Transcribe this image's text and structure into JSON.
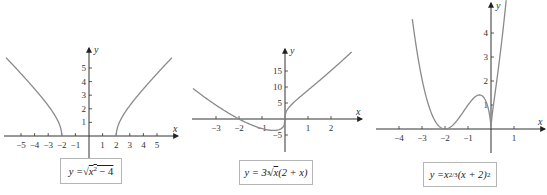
{
  "chart_data": [
    {
      "type": "line",
      "title": "y = √(x² − 4)",
      "caption": {
        "prefix": "y = ",
        "radical": "√",
        "radicand_base": "x",
        "radicand_exp": "2",
        "radicand_rest": " − 4"
      },
      "xlabel": "x",
      "ylabel": "y",
      "xticks": [
        -5,
        -4,
        -3,
        -2,
        -1,
        1,
        2,
        3,
        4,
        5
      ],
      "xtick_labels": [
        "−5",
        "−4",
        "−3",
        "−2",
        "−1",
        "1",
        "2",
        "3",
        "4",
        "5"
      ],
      "yticks": [
        1,
        2,
        3,
        4,
        5
      ],
      "ytick_labels": [
        "1",
        "2",
        "3",
        "4",
        "5"
      ],
      "xlim": [
        -6.2,
        6.2
      ],
      "ylim": [
        0,
        6
      ],
      "grid": false,
      "series": [
        {
          "name": "left branch",
          "x": [
            -6.1,
            -5,
            -4,
            -3,
            -2.5,
            -2.2,
            -2
          ],
          "y": [
            5.76,
            4.58,
            3.46,
            2.24,
            1.5,
            0.92,
            0
          ]
        },
        {
          "name": "right branch",
          "x": [
            2,
            2.2,
            2.5,
            3,
            4,
            5,
            6.1
          ],
          "y": [
            0,
            0.92,
            1.5,
            2.24,
            3.46,
            4.58,
            5.76
          ]
        }
      ]
    },
    {
      "type": "line",
      "title": "y = 3∛x (2 + x)",
      "caption": {
        "prefix": "y = 3",
        "root_index": "3",
        "radical": "√",
        "radicand": "x",
        "suffix": " (2 + x)"
      },
      "xlabel": "x",
      "ylabel": "y",
      "xticks": [
        -3,
        -2,
        -1,
        1,
        2
      ],
      "xtick_labels": [
        "−3",
        "−2",
        "−1",
        "1",
        "2"
      ],
      "yticks": [
        -5,
        5,
        10,
        15
      ],
      "ytick_labels": [
        "−5",
        "5",
        "10",
        "15"
      ],
      "xlim": [
        -4.0,
        3.0
      ],
      "ylim": [
        -10,
        22
      ],
      "grid": false,
      "series": [
        {
          "name": "curve",
          "x": [
            -4,
            -3,
            -2,
            -1,
            -0.5,
            -0.1,
            0,
            0.1,
            0.5,
            1,
            2,
            2.9
          ],
          "y": [
            9.52,
            4.33,
            0,
            -3,
            -3.57,
            -1.32,
            0,
            1.37,
            5.95,
            9,
            15.12,
            20.96
          ]
        }
      ]
    },
    {
      "type": "line",
      "title": "y = x^(2/3) (x + 2)²",
      "caption": {
        "prefix": "y = ",
        "base": "x",
        "exp": "2/3",
        "middle": "(x + 2)",
        "exp2": "2"
      },
      "xlabel": "x",
      "ylabel": "y",
      "xticks": [
        -4,
        -3,
        -2,
        -1,
        1
      ],
      "xtick_labels": [
        "−4",
        "−3",
        "−2",
        "−1",
        "1"
      ],
      "yticks": [
        1,
        2,
        3,
        4
      ],
      "ytick_labels": [
        "1",
        "2",
        "3",
        "4"
      ],
      "xlim": [
        -4.6,
        1.6
      ],
      "ylim": [
        -1,
        5
      ],
      "grid": false,
      "series": [
        {
          "name": "curve",
          "x": [
            -3.4,
            -3,
            -2.5,
            -2,
            -1.5,
            -1,
            -0.5,
            -0.2,
            0,
            0.2,
            0.5,
            0.66
          ],
          "y": [
            4.43,
            2.08,
            0.46,
            0,
            0.33,
            1,
            1.42,
            1.11,
            0,
            1.65,
            3.94,
            5.35
          ]
        }
      ]
    }
  ]
}
